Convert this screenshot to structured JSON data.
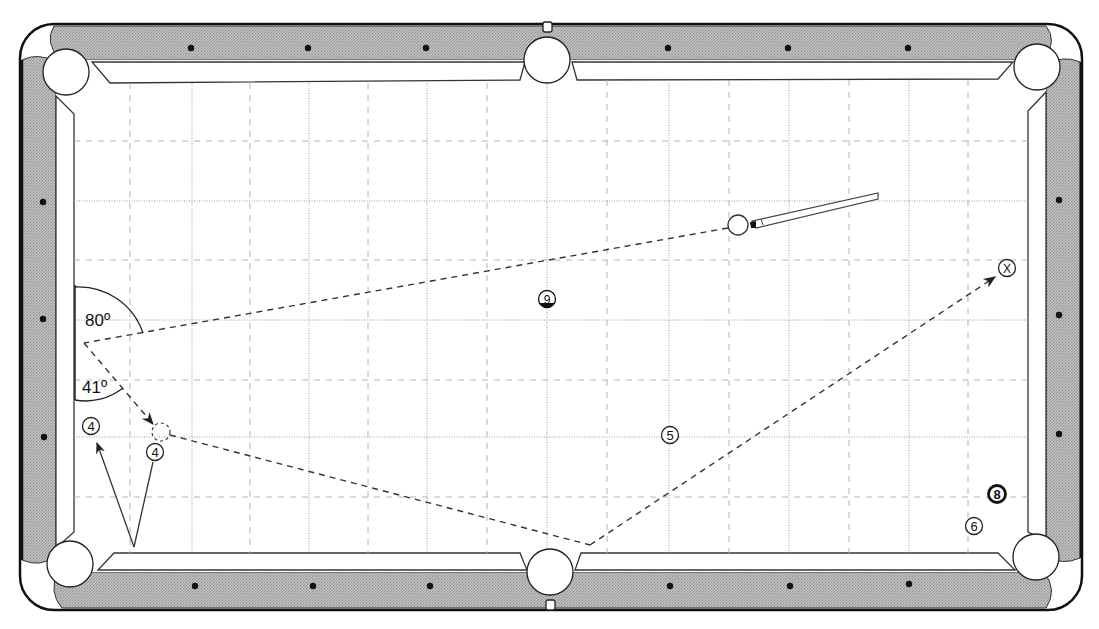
{
  "diagram": {
    "type": "pool-table-bank-shot",
    "colors": {
      "rail": "#b8b8b8",
      "rail_outline": "#1a1a1a",
      "cushion": "#ffffff",
      "felt": "#ffffff",
      "grid_major": "#9a9a9a",
      "grid_minor": "#b0b0b0",
      "shot_line": "#333333",
      "diamond": "#111111"
    },
    "angles": {
      "upper_label": "80º",
      "lower_label": "41º"
    },
    "balls": [
      {
        "id": "ball-9",
        "label": "9",
        "x": 547,
        "y": 299,
        "style": "stripe"
      },
      {
        "id": "ball-5",
        "label": "5",
        "x": 670,
        "y": 435,
        "style": "solid"
      },
      {
        "id": "ball-4a",
        "label": "4",
        "x": 91,
        "y": 426,
        "style": "solid"
      },
      {
        "id": "ball-4b",
        "label": "4",
        "x": 155,
        "y": 452,
        "style": "solid"
      },
      {
        "id": "ball-8",
        "label": "8",
        "x": 997,
        "y": 494,
        "style": "eight"
      },
      {
        "id": "ball-6",
        "label": "6",
        "x": 974,
        "y": 526,
        "style": "solid"
      },
      {
        "id": "target-x",
        "label": "X",
        "x": 1007,
        "y": 268,
        "style": "target"
      }
    ],
    "cue_ball": {
      "x": 738,
      "y": 225
    },
    "ghost_ball": {
      "x": 161,
      "y": 432
    },
    "pockets": [
      {
        "id": "top-left",
        "x": 66,
        "y": 72
      },
      {
        "id": "top-middle",
        "x": 547,
        "y": 59
      },
      {
        "id": "top-right",
        "x": 1037,
        "y": 67
      },
      {
        "id": "bottom-left",
        "x": 70,
        "y": 564
      },
      {
        "id": "bottom-middle",
        "x": 550,
        "y": 573
      },
      {
        "id": "bottom-right",
        "x": 1036,
        "y": 557
      }
    ]
  }
}
